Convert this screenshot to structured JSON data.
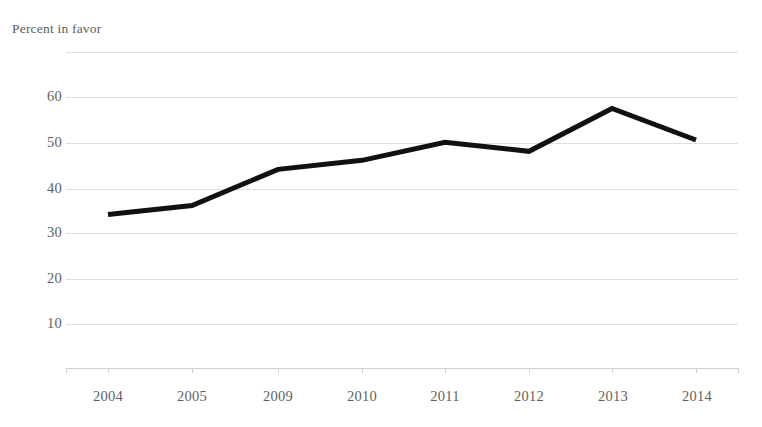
{
  "figure": {
    "clipped_title": "",
    "clipped_footer": "",
    "y_axis_title": "Percent in favor"
  },
  "chart_data": {
    "type": "line",
    "title": "",
    "xlabel": "",
    "ylabel": "Percent in favor",
    "categories": [
      "2004",
      "2005",
      "2009",
      "2010",
      "2011",
      "2012",
      "2013",
      "2014"
    ],
    "values": [
      34,
      36,
      44,
      46,
      50,
      48,
      57.5,
      50.5
    ],
    "series": [
      {
        "name": "Percent in favor",
        "color": "#111111",
        "values": [
          34,
          36,
          44,
          46,
          50,
          48,
          57.5,
          50.5
        ]
      }
    ],
    "ylim": [
      0,
      70
    ],
    "yticks": [
      10,
      20,
      30,
      40,
      50,
      60
    ],
    "ytick_labels": [
      "10",
      "20",
      "30",
      "40",
      "50",
      "60"
    ],
    "grid": true,
    "gridlines_at": [
      0,
      10,
      20,
      30,
      40,
      50,
      60,
      70
    ],
    "legend": "none",
    "line_width": 5,
    "markers": false
  },
  "axis": {
    "y_labels": [
      "60",
      "50",
      "40",
      "30",
      "20",
      "10"
    ],
    "x_labels": [
      "2004",
      "2005",
      "2009",
      "2010",
      "2011",
      "2012",
      "2013",
      "2014"
    ]
  },
  "colors": {
    "line": "#111111",
    "grid": "#dedee0",
    "text": "#5f5f61",
    "background": "#ffffff"
  }
}
